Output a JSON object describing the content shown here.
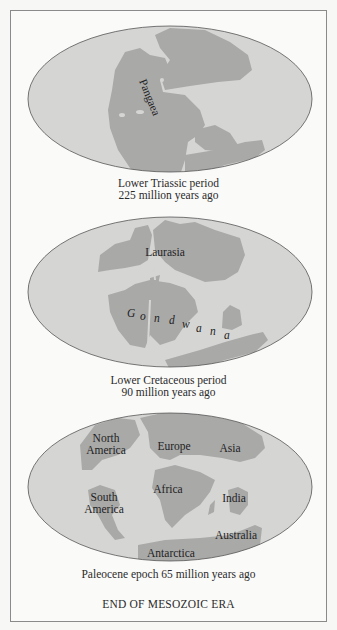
{
  "colors": {
    "ocean": "#d5d5d4",
    "land": "#a9a9a8",
    "outline": "#555555",
    "frame": "#8a8a8a"
  },
  "maps": [
    {
      "name": "lower-triassic",
      "labels": {
        "pangaea": "Pangaea"
      },
      "caption_line1": "Lower Triassic period",
      "caption_line2": "225 million years ago"
    },
    {
      "name": "lower-cretaceous",
      "labels": {
        "laurasia": "Laurasia",
        "gondwana": [
          "G",
          "o",
          "n",
          "d",
          "w",
          "a",
          "n",
          "a"
        ]
      },
      "caption_line1": "Lower Cretaceous period",
      "caption_line2": "90 million years ago"
    },
    {
      "name": "paleocene",
      "labels": {
        "north_america_1": "North",
        "north_america_2": "America",
        "europe": "Europe",
        "asia": "Asia",
        "africa": "Africa",
        "south_america_1": "South",
        "south_america_2": "America",
        "india": "India",
        "australia": "Australia",
        "antarctica": "Antarctica"
      },
      "caption": "Paleocene epoch 65 million years ago"
    }
  ],
  "footer_title": "END OF MESOZOIC ERA"
}
